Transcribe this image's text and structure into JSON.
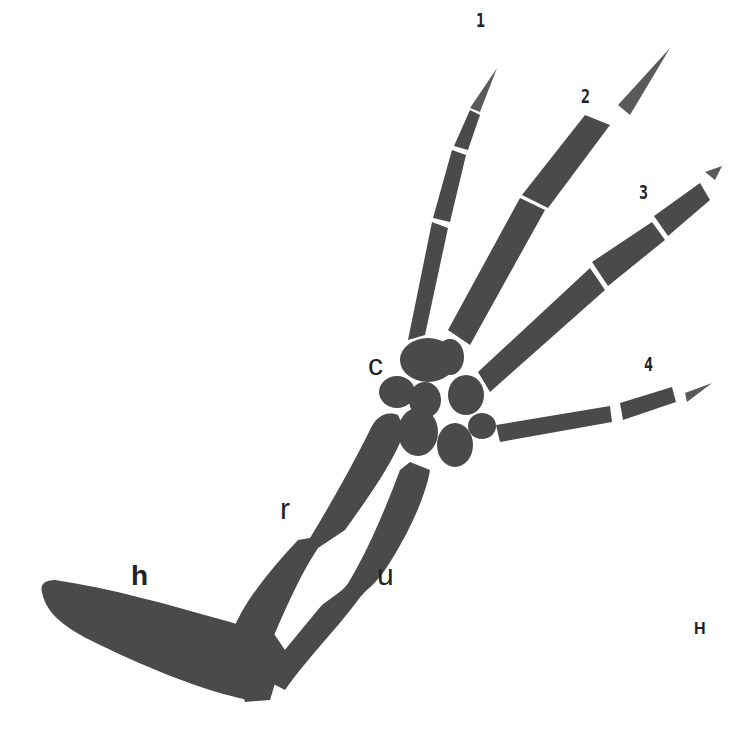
{
  "figure": {
    "panel_label": "H",
    "bone_color": "#4a4a4a",
    "background_color": "#ffffff",
    "labels": {
      "humerus": "h",
      "radius": "r",
      "ulna": "u",
      "carpus": "c",
      "digit_1": "1",
      "digit_2": "2",
      "digit_3": "3",
      "digit_4": "4"
    }
  }
}
